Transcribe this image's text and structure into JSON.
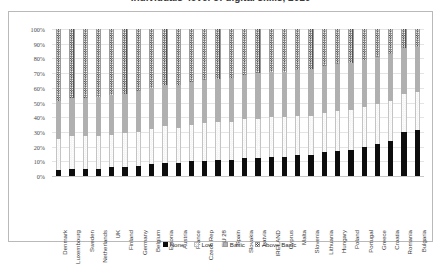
{
  "title": "Individuals' level of digital skills, 2016",
  "chart_data": {
    "type": "bar",
    "subtype": "stacked-100-percent",
    "title": "Individuals' level of digital skills, 2016",
    "xlabel": "",
    "ylabel": "",
    "ylim": [
      0,
      100
    ],
    "ytick_labels": [
      "0%",
      "10%",
      "20%",
      "30%",
      "40%",
      "50%",
      "60%",
      "70%",
      "80%",
      "90%",
      "100%"
    ],
    "ytick_values": [
      0,
      10,
      20,
      30,
      40,
      50,
      60,
      70,
      80,
      90,
      100
    ],
    "grid": true,
    "legend_position": "bottom",
    "stack_order_bottom_to_top": [
      "None",
      "Low",
      "Basic",
      "Above Basic"
    ],
    "categories": [
      "Denmark",
      "Luxembourg",
      "Sweden",
      "Netherlands",
      "UK",
      "Finland",
      "Germany",
      "Belgium",
      "Estonia",
      "Austria",
      "France",
      "Czech Rep",
      "EU 28",
      "Spain",
      "Slovakia",
      "Latvia",
      "IRELAND",
      "Cyprus",
      "Malta",
      "Slovenia",
      "Lithuania",
      "Hungary",
      "Poland",
      "Portugal",
      "Greece",
      "Croatia",
      "Romania",
      "Bulgaria"
    ],
    "series": [
      {
        "name": "None",
        "color": "#0d0d0d",
        "pattern": "solid",
        "values": [
          4,
          5,
          5,
          5,
          6,
          6,
          7,
          8,
          9,
          9,
          10,
          10,
          11,
          11,
          12,
          12,
          13,
          13,
          14,
          14,
          16,
          17,
          18,
          20,
          22,
          24,
          30,
          31
        ]
      },
      {
        "name": "Low",
        "color": "#f2f2f2",
        "pattern": "light-checker",
        "values": [
          21,
          22,
          22,
          22,
          22,
          23,
          23,
          24,
          25,
          24,
          25,
          26,
          26,
          26,
          27,
          27,
          27,
          27,
          27,
          27,
          27,
          27,
          27,
          27,
          27,
          27,
          26,
          26
        ]
      },
      {
        "name": "Basic",
        "color": "#b0b0b0",
        "pattern": "solid",
        "values": [
          26,
          26,
          26,
          27,
          27,
          27,
          28,
          28,
          28,
          29,
          29,
          29,
          29,
          30,
          30,
          31,
          31,
          31,
          31,
          32,
          32,
          32,
          32,
          32,
          32,
          32,
          31,
          31
        ]
      },
      {
        "name": "Above Basic",
        "color": "#4a4a4a",
        "pattern": "dark-checker",
        "values": [
          49,
          47,
          47,
          46,
          45,
          44,
          42,
          40,
          38,
          38,
          36,
          35,
          34,
          33,
          31,
          30,
          29,
          29,
          28,
          27,
          25,
          24,
          23,
          21,
          19,
          17,
          13,
          12
        ]
      }
    ]
  },
  "legend": {
    "items": [
      {
        "label": "None",
        "swatch": "sw-none"
      },
      {
        "label": "Low",
        "swatch": "sw-low"
      },
      {
        "label": "Basic",
        "swatch": "sw-basic"
      },
      {
        "label": "Above Basic",
        "swatch": "sw-abovebasic"
      }
    ]
  }
}
